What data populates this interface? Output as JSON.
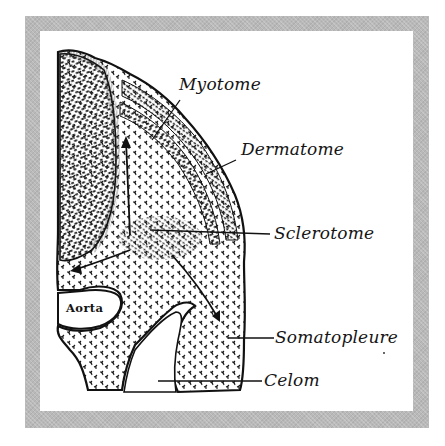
{
  "figure": {
    "type": "anatomical-illustration",
    "colors": {
      "frame": "#b9b9b9",
      "background": "#ffffff",
      "ink": "#151515"
    }
  },
  "labels": {
    "myotome": "Myotome",
    "dermatome": "Dermatome",
    "sclerotome": "Sclerotome",
    "aorta": "Aorta",
    "somatopleure": "Somatopleure",
    "celom": "Celom"
  }
}
